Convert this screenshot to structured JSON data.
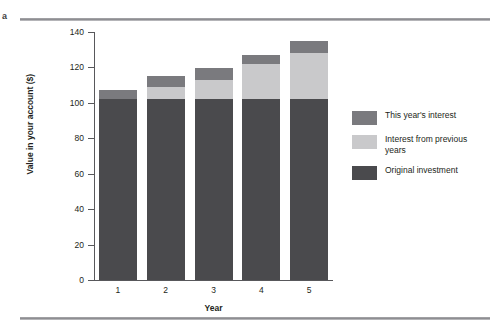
{
  "figure": {
    "panel_letter": "a",
    "divider_color": "#8e8e92"
  },
  "chart_data": {
    "type": "bar",
    "stacked": true,
    "title": "",
    "subtitle": "",
    "xlabel": "Year",
    "ylabel": "Value in your account ($)",
    "categories": [
      "1",
      "2",
      "3",
      "4",
      "5"
    ],
    "xtick_labels": [
      "1",
      "2",
      "3",
      "4",
      "5"
    ],
    "ytick_labels": [
      "0",
      "20",
      "40",
      "60",
      "80",
      "100",
      "120",
      "140"
    ],
    "ytick_values": [
      0,
      20,
      40,
      60,
      80,
      100,
      120,
      140
    ],
    "ylim": [
      0,
      140
    ],
    "grid": false,
    "legend_position": "right",
    "series": [
      {
        "name": "Original investment",
        "color": "#4a4a4d",
        "values": [
          102,
          102,
          102,
          102,
          102
        ]
      },
      {
        "name": "Interest from previous years",
        "color": "#c9c9cb",
        "values": [
          0,
          7,
          11,
          20,
          26
        ]
      },
      {
        "name": "This year's interest",
        "color": "#7a7a7e",
        "values": [
          5,
          6,
          6.5,
          5,
          7
        ]
      }
    ],
    "totals": [
      107,
      115,
      119.5,
      127,
      135
    ],
    "legend_entries": [
      {
        "label": "This year's interest",
        "color": "#7a7a7e"
      },
      {
        "label": "Interest from previous years",
        "color": "#c9c9cb"
      },
      {
        "label": "Original investment",
        "color": "#4a4a4d"
      }
    ]
  }
}
